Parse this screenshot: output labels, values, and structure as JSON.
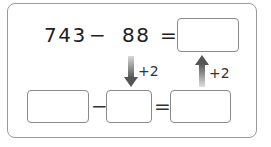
{
  "problem": {
    "minuend": "743",
    "minus_sign": "−",
    "subtrahend": "88",
    "equals_sign": "=",
    "answer_box_value": ""
  },
  "transform": {
    "down_arrow_label": "+2",
    "up_arrow_label": "+2",
    "arrow_color": "#555555"
  },
  "helper_equation": {
    "box1_value": "",
    "minus_sign": "−",
    "box2_value": "",
    "equals_sign": "=",
    "box3_value": ""
  }
}
